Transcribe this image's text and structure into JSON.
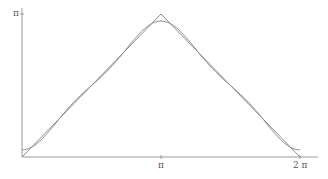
{
  "chart_data": {
    "type": "line",
    "title": "",
    "xlabel": "",
    "ylabel": "",
    "xlim": [
      0,
      6.283185
    ],
    "ylim": [
      0,
      3.141593
    ],
    "grid": false,
    "legend": null,
    "x_ticks": [
      {
        "value": 3.141593,
        "label": "π"
      },
      {
        "value": 6.283185,
        "label": "2 π"
      }
    ],
    "y_ticks": [
      {
        "value": 3.141593,
        "label": "π"
      }
    ],
    "series": [
      {
        "name": "triangle wave",
        "description": "f(x) = π − |x − π| on [0, 2π]",
        "x": [
          0,
          3.141593,
          6.283185
        ],
        "y": [
          0,
          3.141593,
          0
        ]
      },
      {
        "name": "Fourier approximation",
        "description": "π/2 − (4/π)(cos x + cos 3x / 9)",
        "x": [
          0,
          0.785,
          1.571,
          2.356,
          3.142,
          3.927,
          4.712,
          5.498,
          6.283
        ],
        "y": [
          0.156,
          0.764,
          1.571,
          2.378,
          2.985,
          2.378,
          1.571,
          0.764,
          0.156
        ]
      }
    ]
  },
  "colors": {
    "axis": "#9a9a9a",
    "series": "#8c8c8c",
    "text": "#555555"
  },
  "labels": {
    "y_pi": "π",
    "x_pi": "π",
    "x_2pi": "2 π"
  }
}
